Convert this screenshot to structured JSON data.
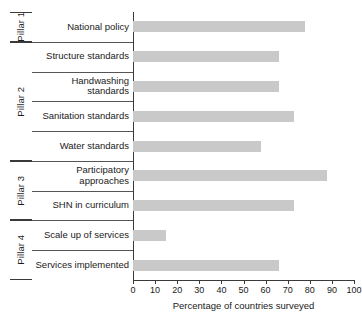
{
  "chart_data": {
    "type": "bar",
    "orientation": "horizontal",
    "title": "",
    "xlabel": "Percentage of countries surveyed",
    "ylabel": "",
    "xlim": [
      0,
      100
    ],
    "xticks": [
      0,
      10,
      20,
      30,
      40,
      50,
      60,
      70,
      80,
      90,
      100
    ],
    "xtick_labels": [
      "0",
      "10",
      "20",
      "30",
      "40",
      "50",
      "60",
      "70",
      "80",
      "90",
      "100"
    ],
    "grid": false,
    "legend": false,
    "bar_color": "#c9c9c9",
    "categories": [
      "National policy",
      "Structure standards",
      "Handwashing standards",
      "Sanitation standards",
      "Water standards",
      "Participatory approaches",
      "SHN in curriculum",
      "Scale up of services",
      "Services implemented"
    ],
    "values": [
      78,
      66,
      66,
      73,
      58,
      88,
      73,
      15,
      66
    ],
    "groups": [
      {
        "label": "Pillar 1",
        "categories": [
          "National policy"
        ]
      },
      {
        "label": "Pillar 2",
        "categories": [
          "Structure standards",
          "Handwashing standards",
          "Sanitation standards",
          "Water standards"
        ]
      },
      {
        "label": "Pillar 3",
        "categories": [
          "Participatory approaches",
          "SHN in curriculum"
        ]
      },
      {
        "label": "Pillar 4",
        "categories": [
          "Scale up of services",
          "Services implemented"
        ]
      }
    ]
  },
  "axis": {
    "x_title": "Percentage of countries surveyed"
  },
  "rows": [
    {
      "label": "National policy",
      "value": 78,
      "group": "Pillar 1"
    },
    {
      "label": "Structure standards",
      "value": 66,
      "group": "Pillar 2"
    },
    {
      "label": "Handwashing standards",
      "value": 66,
      "group": "Pillar 2"
    },
    {
      "label": "Sanitation standards",
      "value": 73,
      "group": "Pillar 2"
    },
    {
      "label": "Water standards",
      "value": 58,
      "group": "Pillar 2"
    },
    {
      "label": "Participatory approaches",
      "value": 88,
      "group": "Pillar 3"
    },
    {
      "label": "SHN in curriculum",
      "value": 73,
      "group": "Pillar 3"
    },
    {
      "label": "Scale up of services",
      "value": 15,
      "group": "Pillar 4"
    },
    {
      "label": "Services implemented",
      "value": 66,
      "group": "Pillar 4"
    }
  ],
  "groups": [
    {
      "label": "Pillar 1",
      "start_row": 0,
      "row_count": 1
    },
    {
      "label": "Pillar 2",
      "start_row": 1,
      "row_count": 4
    },
    {
      "label": "Pillar 3",
      "start_row": 5,
      "row_count": 2
    },
    {
      "label": "Pillar 4",
      "start_row": 7,
      "row_count": 2
    }
  ],
  "ticks": [
    {
      "label": "0",
      "value": 0
    },
    {
      "label": "10",
      "value": 10
    },
    {
      "label": "20",
      "value": 20
    },
    {
      "label": "30",
      "value": 30
    },
    {
      "label": "40",
      "value": 40
    },
    {
      "label": "50",
      "value": 50
    },
    {
      "label": "60",
      "value": 60
    },
    {
      "label": "70",
      "value": 70
    },
    {
      "label": "80",
      "value": 80
    },
    {
      "label": "90",
      "value": 90
    },
    {
      "label": "100",
      "value": 100
    }
  ]
}
